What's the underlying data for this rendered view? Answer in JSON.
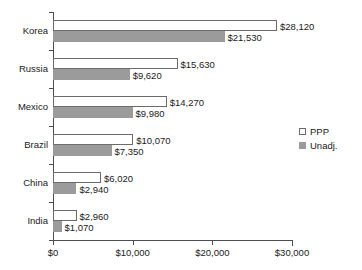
{
  "chart_data": {
    "type": "bar",
    "orientation": "horizontal",
    "title": "",
    "xlabel": "",
    "ylabel": "",
    "categories": [
      "Korea",
      "Russia",
      "Mexico",
      "Brazil",
      "China",
      "India"
    ],
    "series": [
      {
        "name": "PPP",
        "values": [
          28120,
          15630,
          14270,
          10070,
          6020,
          2960
        ],
        "labels": [
          "$28,120",
          "$15,630",
          "$14,270",
          "$10,070",
          "$6,020",
          "$2,960"
        ],
        "fill": "#ffffff",
        "stroke": "#6b6b6b"
      },
      {
        "name": "Unadj.",
        "values": [
          21530,
          9620,
          9980,
          7350,
          2940,
          1070
        ],
        "labels": [
          "$21,530",
          "$9,620",
          "$9,980",
          "$7,350",
          "$2,940",
          "$1,070"
        ],
        "fill": "#9b9b9b",
        "stroke": "#9b9b9b"
      }
    ],
    "xlim": [
      0,
      30000
    ],
    "xticks": [
      0,
      10000,
      20000,
      30000
    ],
    "xticklabels": [
      "$0",
      "$10,000",
      "$20,000",
      "$30,000"
    ],
    "grid": false,
    "legend": {
      "position": "right",
      "entries": [
        {
          "label": "PPP",
          "swatch": "open-square"
        },
        {
          "label": "Unadj.",
          "swatch": "filled-square"
        }
      ]
    }
  }
}
